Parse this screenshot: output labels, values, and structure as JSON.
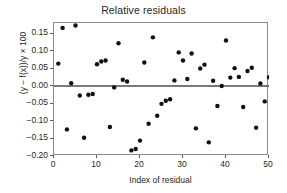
{
  "chart_data": {
    "type": "scatter",
    "title": "Relative residuals",
    "xlabel": "Index of residual",
    "ylabel": "(y − f(x))/y × 100",
    "xlim": [
      0,
      50
    ],
    "ylim": [
      -0.2,
      0.18
    ],
    "grid": false,
    "legend": null,
    "xticks": [
      0,
      10,
      20,
      30,
      40,
      50
    ],
    "xtick_labels": [
      "0",
      "10",
      "20",
      "30",
      "40",
      "50"
    ],
    "yticks": [
      0.15,
      0.1,
      0.05,
      0.0,
      -0.05,
      -0.1,
      -0.15,
      -0.2
    ],
    "ytick_labels": [
      "0.15",
      "0.10",
      "0.05",
      "0.00",
      "-0.05",
      "-0.10",
      "-0.15",
      "-0.20"
    ],
    "marker": "filled-circle",
    "marker_color": "#101010",
    "marker_size": 4.4,
    "reference_line": {
      "type": "horizontal",
      "y": 0.0,
      "color": "#4d4d4d",
      "width": 1.6
    },
    "x": [
      1,
      2,
      3,
      4,
      5,
      6,
      7,
      8,
      9,
      10,
      11,
      12,
      13,
      14,
      15,
      16,
      17,
      18,
      19,
      20,
      21,
      22,
      23,
      24,
      25,
      26,
      27,
      28,
      29,
      30,
      31,
      32,
      33,
      34,
      35,
      36,
      37,
      38,
      39,
      40,
      41,
      42,
      43,
      44,
      45,
      46,
      47,
      48,
      49,
      50
    ],
    "y": [
      0.064,
      0.166,
      -0.124,
      0.008,
      0.173,
      -0.027,
      -0.148,
      -0.025,
      -0.023,
      0.062,
      0.07,
      0.073,
      -0.117,
      -0.004,
      0.122,
      0.018,
      0.013,
      -0.184,
      -0.18,
      -0.156,
      0.067,
      -0.108,
      0.139,
      -0.085,
      -0.051,
      -0.042,
      -0.038,
      0.016,
      0.096,
      0.073,
      0.02,
      0.093,
      -0.121,
      0.05,
      0.061,
      -0.161,
      0.015,
      -0.057,
      0.0,
      0.13,
      0.024,
      0.051,
      0.026,
      -0.06,
      0.043,
      0.052,
      -0.119,
      0.007,
      -0.044,
      0.025
    ]
  }
}
